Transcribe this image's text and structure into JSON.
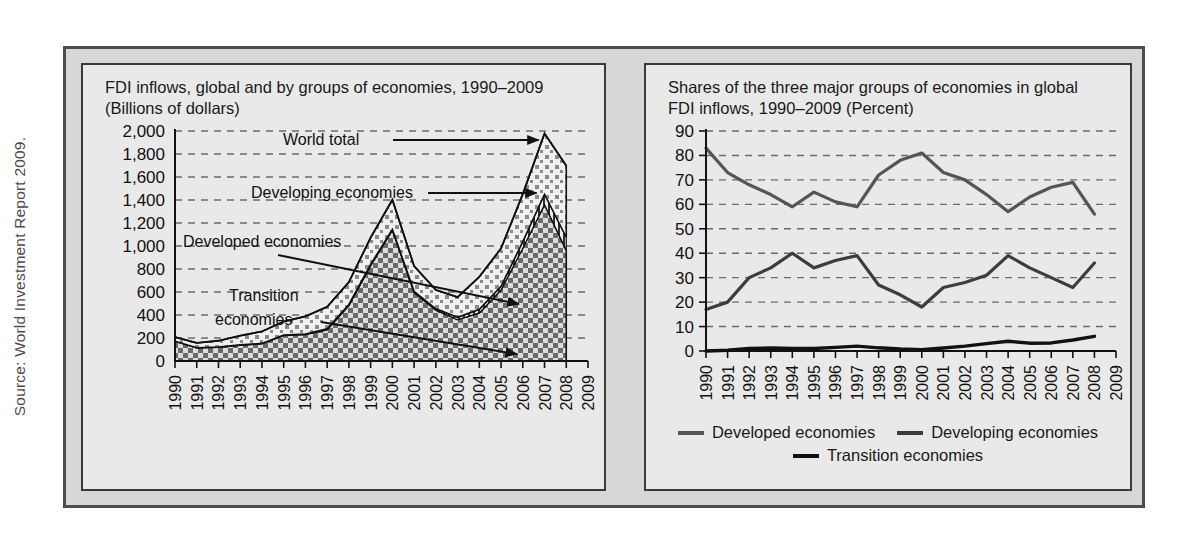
{
  "source_note": "Source: World Investment Report 2009.",
  "left_panel": {
    "title": "FDI inflows, global and by groups of economies, 1990–2009\n(Billions of dollars)",
    "annotations": [
      {
        "label": "World total"
      },
      {
        "label": "Developing economies"
      },
      {
        "label": "Developed economies"
      },
      {
        "label": "Transition\neconomies"
      }
    ]
  },
  "right_panel": {
    "title": "Shares of the three major groups of economies in global\nFDI inflows, 1990–2009 (Percent)",
    "legend": [
      {
        "label": "Developed economies",
        "color": "#555555"
      },
      {
        "label": "Developing economies",
        "color": "#3d3d3d"
      },
      {
        "label": "Transition economies",
        "color": "#111111"
      }
    ]
  },
  "chart_data": [
    {
      "id": "fdi-inflows-levels",
      "type": "area",
      "title": "FDI inflows, global and by groups of economies, 1990–2009 (Billions of dollars)",
      "xlabel": "",
      "ylabel": "Billions of dollars",
      "ylim": [
        0,
        2000
      ],
      "yticks": [
        0,
        200,
        400,
        600,
        800,
        1000,
        1200,
        1400,
        1600,
        1800,
        2000
      ],
      "ytick_labels": [
        "0",
        "200",
        "400",
        "600",
        "800",
        "1,000",
        "1,200",
        "1,400",
        "1,600",
        "1,800",
        "2,000"
      ],
      "grid": true,
      "x": [
        1990,
        1991,
        1992,
        1993,
        1994,
        1995,
        1996,
        1997,
        1998,
        1999,
        2000,
        2001,
        2002,
        2003,
        2004,
        2005,
        2006,
        2007,
        2008,
        2009
      ],
      "xtick_labels": [
        "1990",
        "1991",
        "1992",
        "1993",
        "1994",
        "1995",
        "1996",
        "1997",
        "1998",
        "1999",
        "2000",
        "2001",
        "2002",
        "2003",
        "2004",
        "2005",
        "2006",
        "2007",
        "2008",
        "2009"
      ],
      "stacked": true,
      "series": [
        {
          "name": "Developed economies",
          "fill": "checker-dark",
          "values": [
            172,
            115,
            120,
            138,
            150,
            222,
            230,
            272,
            483,
            830,
            1138,
            596,
            442,
            359,
            418,
            619,
            981,
            1359,
            962,
            null
          ]
        },
        {
          "name": "Transition economies",
          "fill": "hatch-vertical",
          "values": [
            0,
            0,
            1,
            2,
            3,
            4,
            5,
            8,
            9,
            10,
            7,
            10,
            12,
            21,
            31,
            31,
            57,
            91,
            114,
            null
          ]
        },
        {
          "name": "Developing economies",
          "fill": "checker-light",
          "values": [
            36,
            42,
            55,
            80,
            104,
            117,
            153,
            191,
            194,
            232,
            257,
            219,
            164,
            175,
            283,
            329,
            413,
            529,
            621,
            null
          ]
        },
        {
          "name": "World total",
          "fill": "none",
          "values": [
            208,
            157,
            176,
            220,
            257,
            343,
            388,
            471,
            686,
            1072,
            1402,
            825,
            618,
            555,
            732,
            979,
            1451,
            1979,
            1697,
            null
          ]
        }
      ]
    },
    {
      "id": "fdi-shares",
      "type": "line",
      "title": "Shares of the three major groups of economies in global FDI inflows, 1990–2009 (Percent)",
      "xlabel": "",
      "ylabel": "Percent",
      "ylim": [
        0,
        90
      ],
      "yticks": [
        0,
        10,
        20,
        30,
        40,
        50,
        60,
        70,
        80,
        90
      ],
      "ytick_labels": [
        "0",
        "10",
        "20",
        "30",
        "40",
        "50",
        "60",
        "70",
        "80",
        "90"
      ],
      "grid": true,
      "legend_position": "bottom",
      "x": [
        1990,
        1991,
        1992,
        1993,
        1994,
        1995,
        1996,
        1997,
        1998,
        1999,
        2000,
        2001,
        2002,
        2003,
        2004,
        2005,
        2006,
        2007,
        2008,
        2009
      ],
      "xtick_labels": [
        "1990",
        "1991",
        "1992",
        "1993",
        "1994",
        "1995",
        "1996",
        "1997",
        "1998",
        "1999",
        "2000",
        "2001",
        "2002",
        "2003",
        "2004",
        "2005",
        "2006",
        "2007",
        "2008",
        "2009"
      ],
      "series": [
        {
          "name": "Developed economies",
          "color": "#555555",
          "values": [
            83,
            73,
            68,
            64,
            59,
            65,
            61,
            59,
            72,
            78,
            81,
            73,
            70,
            64,
            57,
            63,
            67,
            69,
            56,
            null
          ]
        },
        {
          "name": "Developing economies",
          "color": "#3d3d3d",
          "values": [
            17,
            20,
            30,
            34,
            40,
            34,
            37,
            39,
            27,
            23,
            18,
            26,
            28,
            31,
            39,
            34,
            30,
            26,
            36,
            null
          ]
        },
        {
          "name": "Transition economies",
          "color": "#111111",
          "values": [
            0,
            0.3,
            1,
            1.2,
            1,
            1,
            1.5,
            2,
            1.3,
            0.8,
            0.5,
            1.2,
            2,
            3,
            4,
            3.2,
            3.3,
            4.5,
            6,
            null
          ]
        }
      ]
    }
  ]
}
